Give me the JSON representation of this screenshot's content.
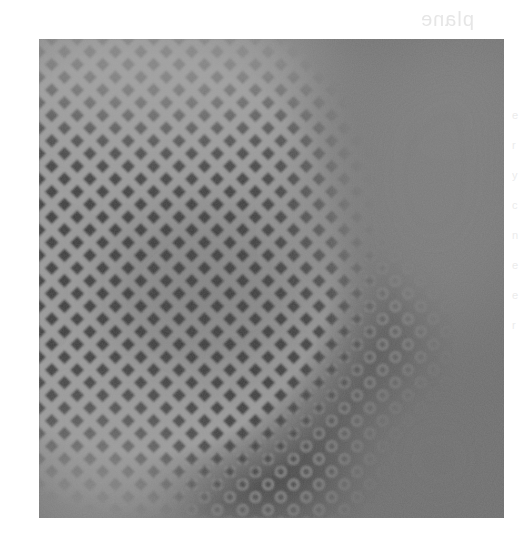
{
  "page": {
    "ghost_text": "plane",
    "ghost_margin_marks": [
      "e",
      "r",
      "y",
      "c",
      "n",
      "e",
      "e",
      "r"
    ]
  },
  "photo": {
    "description": "Grayscale halftone texture: diamond lattice transitioning into ring dots, with smooth gray blobs",
    "palette": {
      "lattice_light": "#9c9c9c",
      "diamond_dark": "#3f3f3f",
      "haze_top_left": "#979797",
      "blob_right": "#7b7b7b",
      "bottom_right": "#6f6f6f",
      "bottom_left_light": "#8f8f8f",
      "ring": "#8a8a8a"
    },
    "regions": [
      {
        "name": "top-left-haze",
        "tone": "light"
      },
      {
        "name": "top-right-blob",
        "tone": "medium"
      },
      {
        "name": "center-diamond-band",
        "tone": "dark"
      },
      {
        "name": "center-right-ring-dots",
        "tone": "dark"
      },
      {
        "name": "bottom-left-light",
        "tone": "light"
      },
      {
        "name": "bottom-right-plain",
        "tone": "medium"
      }
    ]
  }
}
